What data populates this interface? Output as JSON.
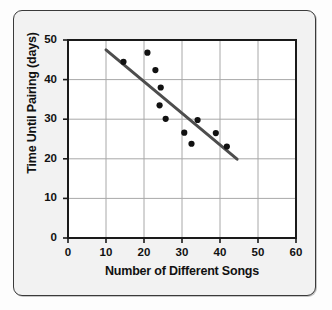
{
  "chart_data": {
    "type": "scatter",
    "title": "",
    "subtitle": "",
    "xlabel": "Number of Different Songs",
    "ylabel": "Time Until Pairing (days)",
    "xlim": [
      0,
      60
    ],
    "ylim": [
      0,
      50
    ],
    "xticks": [
      0,
      10,
      20,
      30,
      40,
      50,
      60
    ],
    "yticks": [
      0,
      10,
      20,
      30,
      40,
      50
    ],
    "xtick_labels": [
      "0",
      "10",
      "20",
      "30",
      "40",
      "50",
      "60"
    ],
    "ytick_labels": [
      "0",
      "10",
      "20",
      "30",
      "40",
      "50"
    ],
    "grid": true,
    "legend": false,
    "legend_position": "none",
    "marker": "filled-circle",
    "marker_color": "#111111",
    "points": [
      {
        "x": 14.6,
        "y": 44.5
      },
      {
        "x": 20.9,
        "y": 46.8
      },
      {
        "x": 23.0,
        "y": 42.4
      },
      {
        "x": 24.4,
        "y": 38.0
      },
      {
        "x": 24.1,
        "y": 33.5
      },
      {
        "x": 25.7,
        "y": 30.1
      },
      {
        "x": 30.6,
        "y": 26.6
      },
      {
        "x": 32.5,
        "y": 23.8
      },
      {
        "x": 34.1,
        "y": 29.8
      },
      {
        "x": 38.9,
        "y": 26.5
      },
      {
        "x": 41.8,
        "y": 23.1
      }
    ],
    "trend_line": {
      "type": "line-of-best-fit",
      "color": "#4d4d4d",
      "x_start": 10.0,
      "y_start": 47.5,
      "x_end": 44.5,
      "y_end": 19.9
    },
    "colors": {
      "plot_background": "#ffffff",
      "figure_background": "#f2f2f2",
      "grid": "#a8a8a8",
      "axis": "#1a1a1a",
      "point": "#111111",
      "trend": "#4d4d4d",
      "frame_border": "#3a3a3a"
    }
  }
}
